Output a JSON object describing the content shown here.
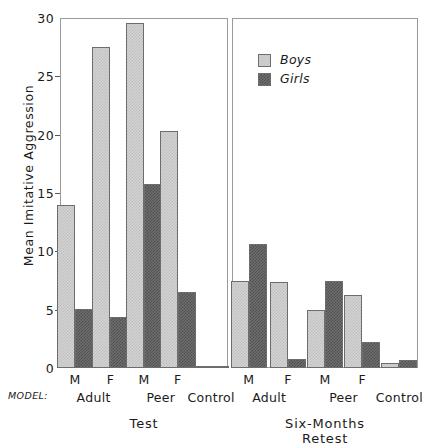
{
  "chart_data": {
    "type": "bar",
    "title": "",
    "xlabel": "MODEL:",
    "ylabel": "Mean Imitative Aggression",
    "ylim": [
      0,
      30
    ],
    "yticks": [
      0,
      5,
      10,
      15,
      20,
      25,
      30
    ],
    "ytick_labels": [
      "0",
      "5",
      "10",
      "15",
      "20",
      "25",
      "30"
    ],
    "grid": false,
    "legend_position": "upper-center-right",
    "legend": [
      "Boys",
      "Girls"
    ],
    "series": [
      {
        "name": "Boys",
        "color": "#d3d3d3",
        "values": [
          14.0,
          27.5,
          29.6,
          20.3,
          0.2,
          7.5,
          7.4,
          5.0,
          6.3,
          0.4
        ]
      },
      {
        "name": "Girls",
        "color": "#6e6e6e",
        "values": [
          5.1,
          4.4,
          15.8,
          6.5,
          0.2,
          10.6,
          0.8,
          7.5,
          2.2,
          0.7
        ]
      }
    ],
    "panels": [
      {
        "label": "Test",
        "groups": [
          {
            "model": "Adult",
            "sex": "M",
            "boys": 14.0,
            "girls": 5.1
          },
          {
            "model": "Adult",
            "sex": "F",
            "boys": 27.5,
            "girls": 4.4
          },
          {
            "model": "Peer",
            "sex": "M",
            "boys": 29.6,
            "girls": 15.8
          },
          {
            "model": "Peer",
            "sex": "F",
            "boys": 20.3,
            "girls": 6.5
          },
          {
            "model": "Control",
            "sex": "",
            "boys": 0.2,
            "girls": 0.2
          }
        ]
      },
      {
        "label": "Six-Months Retest",
        "groups": [
          {
            "model": "Adult",
            "sex": "M",
            "boys": 7.5,
            "girls": 10.6
          },
          {
            "model": "Adult",
            "sex": "F",
            "boys": 7.4,
            "girls": 0.8
          },
          {
            "model": "Peer",
            "sex": "M",
            "boys": 5.0,
            "girls": 7.5
          },
          {
            "model": "Peer",
            "sex": "F",
            "boys": 6.3,
            "girls": 2.2
          },
          {
            "model": "Control",
            "sex": "",
            "boys": 0.4,
            "girls": 0.7
          }
        ]
      }
    ],
    "axis_label_model": "MODEL:",
    "colors": {
      "boys": "#d3d3d3",
      "girls": "#6e6e6e",
      "frame": "#9a9a9a",
      "text": "#1a1a1a"
    }
  }
}
